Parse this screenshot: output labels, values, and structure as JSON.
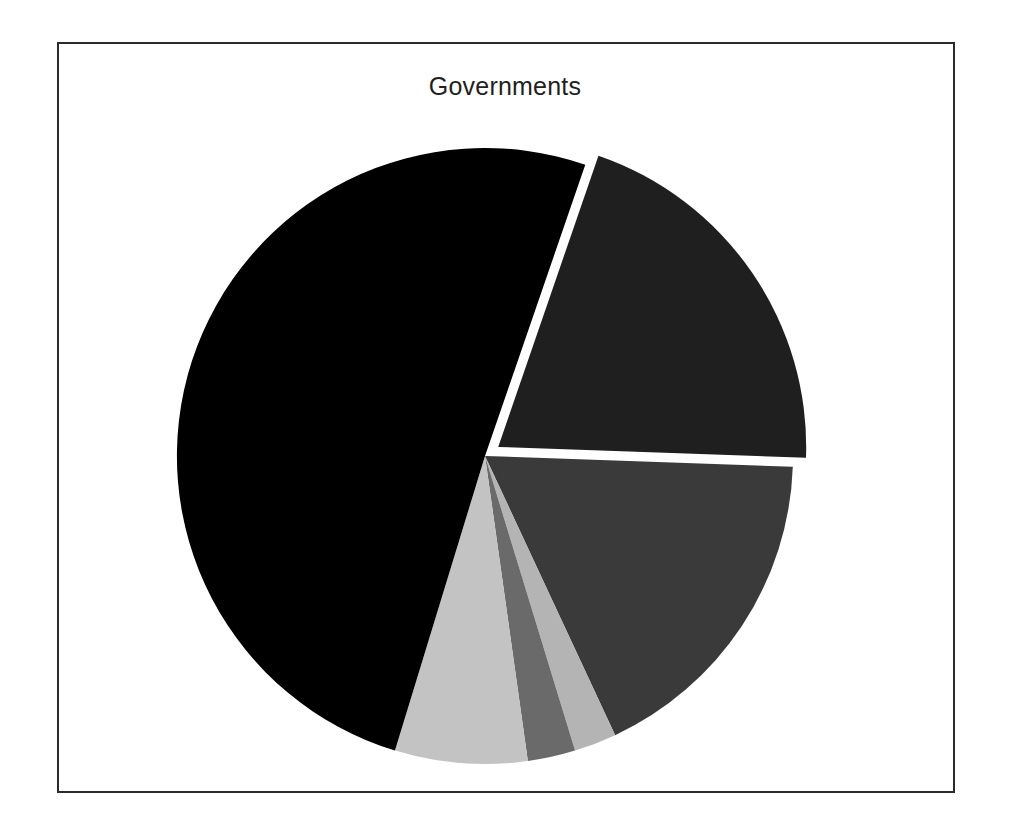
{
  "figure": {
    "title": "Governments",
    "background_color": "#ffffff",
    "frame_color": "#2b2b2b",
    "title_color": "#231f20"
  },
  "chart_data": {
    "type": "pie",
    "title": "Governments",
    "xlabel": "",
    "ylabel": "",
    "legend": "none",
    "grid": false,
    "start_angle_deg": 19,
    "direction": "clockwise",
    "exploded_slices": [
      "slice-1"
    ],
    "categories": [
      "slice-1",
      "slice-2",
      "slice-3",
      "slice-4",
      "slice-5",
      "slice-6"
    ],
    "values": [
      20.3,
      17.5,
      2.2,
      2.5,
      7.0,
      50.5
    ],
    "colors": [
      "#1f1f1f",
      "#3a3a3a",
      "#b4b4b4",
      "#6a6a6a",
      "#c3c3c3",
      "#000000"
    ],
    "slices": [
      {
        "name": "slice-1",
        "value": 20.3,
        "color": "#1f1f1f",
        "start_deg": 19,
        "end_deg": 92,
        "exploded": true,
        "explode_offset_px": 16,
        "label": ""
      },
      {
        "name": "slice-2",
        "value": 17.5,
        "color": "#3a3a3a",
        "start_deg": 92,
        "end_deg": 155,
        "exploded": false,
        "explode_offset_px": 0,
        "label": ""
      },
      {
        "name": "slice-3",
        "value": 2.2,
        "color": "#b4b4b4",
        "start_deg": 155,
        "end_deg": 163,
        "exploded": false,
        "explode_offset_px": 0,
        "label": ""
      },
      {
        "name": "slice-4",
        "value": 2.5,
        "color": "#6a6a6a",
        "start_deg": 163,
        "end_deg": 172,
        "exploded": false,
        "explode_offset_px": 0,
        "label": ""
      },
      {
        "name": "slice-5",
        "value": 7.0,
        "color": "#c3c3c3",
        "start_deg": 172,
        "end_deg": 197,
        "exploded": false,
        "explode_offset_px": 0,
        "label": ""
      },
      {
        "name": "slice-6",
        "value": 50.5,
        "color": "#000000",
        "start_deg": 197,
        "end_deg": 379,
        "exploded": false,
        "explode_offset_px": 0,
        "label": ""
      }
    ],
    "geometry": {
      "center_x": 428,
      "center_y": 414,
      "radius": 308
    }
  }
}
